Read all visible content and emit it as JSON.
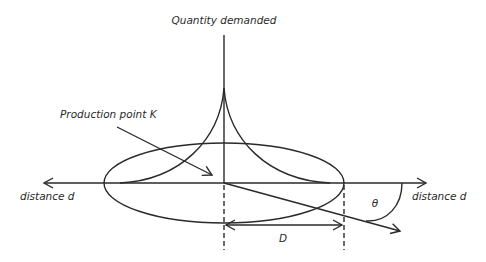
{
  "diagram": {
    "labels": {
      "vertical_axis": "Quantity demanded",
      "production_point": "Production point K",
      "axis_left": "distance d",
      "axis_right": "distance d",
      "radius": "D",
      "angle": "θ"
    },
    "colors": {
      "stroke": "#2a2a2a",
      "background": "#ffffff"
    }
  }
}
